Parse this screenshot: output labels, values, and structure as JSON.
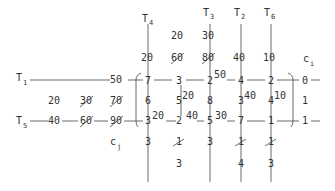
{
  "diagram": {
    "type": "transportation-tableau",
    "column_labels": [
      {
        "name": "T",
        "sub": "4",
        "x": 148
      },
      {
        "name": "T",
        "sub": "3",
        "x": 210
      },
      {
        "name": "T",
        "sub": "2",
        "x": 241
      },
      {
        "name": "T",
        "sub": "6",
        "x": 271
      }
    ],
    "row_labels": [
      {
        "name": "T",
        "sub": "1",
        "y": 80
      },
      {
        "name": "T",
        "sub": "5",
        "y": 121
      }
    ],
    "ci_label": {
      "name": "c",
      "sub": "i"
    },
    "cj_label": {
      "name": "c",
      "sub": "j"
    },
    "demands_top": [
      {
        "text": "20",
        "x": 177,
        "y": 39,
        "struck": false
      },
      {
        "text": "30",
        "x": 208,
        "y": 39,
        "struck": false
      },
      {
        "text": "20",
        "x": 147,
        "y": 60,
        "struck": false
      },
      {
        "text": "60",
        "x": 177,
        "y": 60,
        "struck": true
      },
      {
        "text": "80",
        "x": 208,
        "y": 60,
        "struck": true
      },
      {
        "text": "40",
        "x": 239,
        "y": 60,
        "struck": false
      },
      {
        "text": "10",
        "x": 269,
        "y": 60,
        "struck": false
      }
    ],
    "supplies_left": [
      {
        "text": "50",
        "x": 116,
        "y": 83,
        "struck": false
      },
      {
        "text": "20",
        "x": 54,
        "y": 103,
        "struck": false
      },
      {
        "text": "30",
        "x": 86,
        "y": 103,
        "struck": true
      },
      {
        "text": "70",
        "x": 116,
        "y": 103,
        "struck": true
      },
      {
        "text": "40",
        "x": 54,
        "y": 124,
        "struck": false
      },
      {
        "text": "60",
        "x": 86,
        "y": 124,
        "struck": true
      },
      {
        "text": "90",
        "x": 116,
        "y": 124,
        "struck": true
      }
    ],
    "row1_costs": [
      "7",
      "3",
      "2",
      "4",
      "2"
    ],
    "row_mid_costs": [
      "6",
      "5",
      "8",
      "3",
      "4"
    ],
    "row2_costs": [
      "3",
      "2",
      "5",
      "7",
      "1"
    ],
    "allocations": [
      {
        "text": "50",
        "x": 216,
        "y": 77
      },
      {
        "text": "20",
        "x": 183,
        "y": 99
      },
      {
        "text": "40",
        "x": 245,
        "y": 99
      },
      {
        "text": "10",
        "x": 275,
        "y": 99
      },
      {
        "text": "20",
        "x": 152,
        "y": 118
      },
      {
        "text": "40",
        "x": 185,
        "y": 118
      },
      {
        "text": "30",
        "x": 215,
        "y": 118
      }
    ],
    "ci_values": [
      "0",
      "1",
      "1"
    ],
    "cj_row1": [
      {
        "text": "3",
        "struck": false
      },
      {
        "text": "1",
        "struck": true
      },
      {
        "text": "3",
        "struck": false
      },
      {
        "text": "1",
        "struck": true
      },
      {
        "text": "1",
        "struck": true
      }
    ],
    "cj_row2": [
      {
        "text": "",
        "struck": false
      },
      {
        "text": "3",
        "struck": false
      },
      {
        "text": "",
        "struck": false
      },
      {
        "text": "4",
        "struck": false
      },
      {
        "text": "3",
        "struck": false
      }
    ]
  }
}
